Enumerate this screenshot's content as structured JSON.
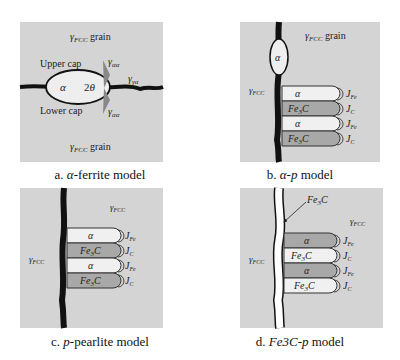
{
  "colors": {
    "panel_bg": "#d4d4d4",
    "boundary": "#111111",
    "ferrite_fill": "#f2f2f2",
    "cementite_fill": "#a8a8a8",
    "cementite_light": "#f2f2f2",
    "ferrite_dark": "#a8a8a8"
  },
  "panels": [
    {
      "id": "a",
      "caption_prefix": "a.",
      "caption_italic": "α",
      "caption_rest": "-ferrite model",
      "labels": {
        "top_grain": "γFCC grain",
        "bottom_grain": "γFCC grain",
        "upper_cap": "Upper cap",
        "lower_cap": "Lower cap",
        "alpha": "α",
        "angle": "2θ",
        "gamma_aa_top": "γαα",
        "gamma_ga": "γγα",
        "gamma_aa_bottom": "γαα"
      }
    },
    {
      "id": "b",
      "caption_prefix": "b.",
      "caption_italic": "α-p",
      "caption_rest": " model",
      "labels": {
        "top_grain": "γFCC grain",
        "left_gamma": "γFCC",
        "alpha_nodule": "α",
        "lamellae": [
          "α",
          "Fe3C",
          "α",
          "Fe3C"
        ],
        "fluxes": [
          "JFe",
          "JC",
          "JFe",
          "JC"
        ]
      }
    },
    {
      "id": "c",
      "caption_prefix": "c.",
      "caption_italic": "p",
      "caption_rest": "-pearlite model",
      "labels": {
        "right_gamma": "γFCC",
        "left_gamma": "γFCC",
        "lamellae": [
          "α",
          "Fe3C",
          "α",
          "Fe3C"
        ],
        "fluxes": [
          "JFe",
          "JC",
          "JFe",
          "JC"
        ]
      }
    },
    {
      "id": "d",
      "caption_prefix": "d.",
      "caption_italic": "Fe3C-p",
      "caption_rest": " model",
      "labels": {
        "film": "Fe3C",
        "right_gamma": "γFCC",
        "left_gamma": "γFCC",
        "lamellae": [
          "α",
          "Fe3C",
          "α",
          "Fe3C"
        ],
        "fluxes": [
          "JFe",
          "JC",
          "JFe",
          "JC"
        ]
      }
    }
  ]
}
